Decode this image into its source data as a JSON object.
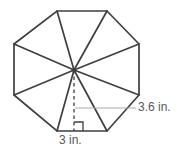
{
  "figure": {
    "shape_name": "regular octagon",
    "stroke_color": "#3f3f3f",
    "leader_color": "#a7a9ac",
    "text_color": "#58595b",
    "background_color": "#ffffff"
  },
  "labels": {
    "apothem": "3.6 in.",
    "side": "3 in."
  },
  "geometry": {
    "center": {
      "x": 74,
      "y": 70
    },
    "vertices": [
      {
        "x": 57,
        "y": 11
      },
      {
        "x": 107,
        "y": 11
      },
      {
        "x": 139,
        "y": 44
      },
      {
        "x": 139,
        "y": 95
      },
      {
        "x": 107,
        "y": 131
      },
      {
        "x": 57,
        "y": 131
      },
      {
        "x": 14,
        "y": 95
      },
      {
        "x": 14,
        "y": 44
      }
    ],
    "apothem_line": {
      "x1": 74,
      "y1": 70,
      "x2": 74,
      "y2": 131
    },
    "leader_line": {
      "x1": 75,
      "y1": 108,
      "x2": 136,
      "y2": 108
    },
    "right_angle_marker": {
      "x": 74,
      "y": 131,
      "size": 9
    }
  }
}
